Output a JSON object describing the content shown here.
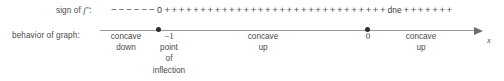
{
  "figure": {
    "type": "sign-chart",
    "title": "",
    "axis_variable": "x"
  },
  "rows": [
    {
      "label_prefix": "sign of ",
      "label_fn": "f",
      "label_prime": "′′",
      "label_suffix": ":",
      "label_full": "sign of f′′:"
    },
    {
      "label_full": "behavior of graph:"
    }
  ],
  "sign_strip": {
    "minus_sign": "−",
    "plus_sign": "+",
    "zero_label": "0",
    "dne_label": "dne",
    "segments": [
      {
        "kind": "minus",
        "count": 6
      },
      {
        "kind": "zero",
        "count": 1
      },
      {
        "kind": "plus",
        "count": 31
      },
      {
        "kind": "dne",
        "count": 1
      },
      {
        "kind": "plus",
        "count": 7
      }
    ]
  },
  "axis": {
    "variable": "x",
    "critical_points": [
      {
        "value": "−1",
        "position_pct": 14.8
      },
      {
        "value": "0",
        "position_pct": 70.1
      }
    ]
  },
  "behavior_cells": [
    {
      "name": "concave-down",
      "lines": [
        "concave",
        "down"
      ]
    },
    {
      "name": "inflection-point",
      "value": "−1",
      "lines": [
        "point",
        "of",
        "inflection"
      ]
    },
    {
      "name": "concave-up-left",
      "lines": [
        "concave",
        "up"
      ]
    },
    {
      "name": "zero-marker",
      "value": "0",
      "lines": []
    },
    {
      "name": "concave-up-right",
      "lines": [
        "concave",
        "up"
      ]
    }
  ],
  "colors": {
    "text": "#4a4a4a",
    "axis": "#9a9a9a",
    "dot": "#2e2e2e",
    "background": "#ffffff"
  }
}
